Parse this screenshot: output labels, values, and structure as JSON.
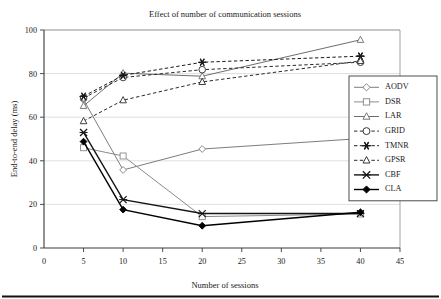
{
  "figure": {
    "background": "#ffffff",
    "bottom_rule": true
  },
  "chart_data": {
    "type": "line",
    "title": "Effect of number of communication sessions",
    "xlabel": "Number of sessions",
    "ylabel": "End-to-end delay (ms)",
    "x": [
      5,
      10,
      20,
      40
    ],
    "xlim": [
      0,
      45
    ],
    "ylim": [
      0,
      100
    ],
    "xticks": [
      0,
      5,
      10,
      15,
      20,
      25,
      30,
      35,
      40,
      45
    ],
    "yticks": [
      0,
      20,
      40,
      60,
      80,
      100
    ],
    "xtick_labels": [
      "0",
      "5",
      "10",
      "15",
      "20",
      "25",
      "30",
      "35",
      "40",
      "45"
    ],
    "ytick_labels": [
      "0",
      "20",
      "40",
      "60",
      "80",
      "100"
    ],
    "grid": "horizontal",
    "legend_position": "right-middle",
    "series": [
      {
        "name": "AODV",
        "values": [
          68,
          35.8,
          45.4,
          50.2
        ],
        "marker": "diamond-open",
        "dash": "solid",
        "color": "#7d7d7d"
      },
      {
        "name": "DSR",
        "values": [
          46,
          42.2,
          14.4,
          15.6
        ],
        "marker": "square-open",
        "dash": "solid",
        "color": "#8a8a8a"
      },
      {
        "name": "LAR",
        "values": [
          65.2,
          80.2,
          78.8,
          95.5
        ],
        "marker": "triangle-open",
        "dash": "solid",
        "color": "#6e6e6e"
      },
      {
        "name": "GRID",
        "values": [
          68.8,
          78.2,
          81.8,
          85.2
        ],
        "marker": "circle-open",
        "dash": "dashed",
        "color": "#2a2a2a"
      },
      {
        "name": "TMNR",
        "values": [
          69.6,
          79.2,
          85.2,
          88.0
        ],
        "marker": "asterisk",
        "dash": "dashed",
        "color": "#1a1a1a"
      },
      {
        "name": "GPSR",
        "values": [
          58.2,
          67.8,
          76.2,
          85.8
        ],
        "marker": "triangle-open",
        "dash": "dashed",
        "color": "#2a2a2a"
      },
      {
        "name": "CBF",
        "values": [
          53.0,
          22.2,
          15.8,
          15.8
        ],
        "marker": "x-cross",
        "dash": "solid",
        "color": "#151515"
      },
      {
        "name": "CLA",
        "values": [
          48.8,
          17.6,
          10.2,
          16.4
        ],
        "marker": "diamond-filled",
        "dash": "solid",
        "color": "#000000"
      }
    ]
  },
  "legend": {
    "entries": [
      {
        "label": "AODV"
      },
      {
        "label": "DSR"
      },
      {
        "label": "LAR"
      },
      {
        "label": "GRID"
      },
      {
        "label": "TMNR"
      },
      {
        "label": "GPSR"
      },
      {
        "label": "CBF"
      },
      {
        "label": "CLA"
      }
    ]
  }
}
